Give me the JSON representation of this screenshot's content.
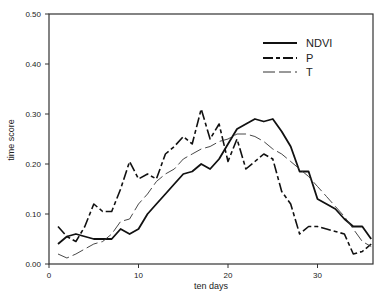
{
  "chart_data": {
    "type": "line",
    "title": "",
    "xlabel": "ten days",
    "ylabel": "time score",
    "xlim": [
      0,
      36.2
    ],
    "ylim": [
      0,
      0.5
    ],
    "xticks": [
      0,
      10,
      20,
      30
    ],
    "xtick_labels": [
      "0",
      "10",
      "20",
      "30"
    ],
    "yticks": [
      0,
      0.1,
      0.2,
      0.3,
      0.4,
      0.5
    ],
    "ytick_labels": [
      "0.00",
      "0.10",
      "0.20",
      "0.30",
      "0.40",
      "0.50"
    ],
    "grid": false,
    "legend_position": "upper right",
    "x": [
      1,
      2,
      3,
      4,
      5,
      6,
      7,
      8,
      9,
      10,
      11,
      12,
      13,
      14,
      15,
      16,
      17,
      18,
      19,
      20,
      21,
      22,
      23,
      24,
      25,
      26,
      27,
      28,
      29,
      30,
      31,
      32,
      33,
      34,
      35,
      36
    ],
    "series": [
      {
        "name": "NDVI",
        "style": "solid",
        "values": [
          0.04,
          0.055,
          0.06,
          0.055,
          0.05,
          0.05,
          0.05,
          0.07,
          0.06,
          0.07,
          0.1,
          0.12,
          0.14,
          0.16,
          0.18,
          0.185,
          0.2,
          0.19,
          0.21,
          0.24,
          0.27,
          0.28,
          0.29,
          0.285,
          0.29,
          0.265,
          0.235,
          0.185,
          0.185,
          0.13,
          0.12,
          0.11,
          0.09,
          0.075,
          0.075,
          0.05
        ]
      },
      {
        "name": "P",
        "style": "dash-dot",
        "values": [
          0.075,
          0.055,
          0.045,
          0.075,
          0.12,
          0.105,
          0.105,
          0.15,
          0.205,
          0.17,
          0.18,
          0.17,
          0.22,
          0.235,
          0.255,
          0.24,
          0.31,
          0.25,
          0.28,
          0.205,
          0.25,
          0.19,
          0.205,
          0.22,
          0.21,
          0.145,
          0.12,
          0.06,
          0.075,
          0.075,
          0.07,
          0.065,
          0.06,
          0.02,
          0.025,
          0.04
        ]
      },
      {
        "name": "T",
        "style": "long-dash",
        "values": [
          0.02,
          0.012,
          0.02,
          0.03,
          0.04,
          0.045,
          0.06,
          0.085,
          0.09,
          0.12,
          0.14,
          0.165,
          0.18,
          0.19,
          0.21,
          0.22,
          0.23,
          0.235,
          0.245,
          0.25,
          0.26,
          0.26,
          0.255,
          0.245,
          0.23,
          0.22,
          0.205,
          0.19,
          0.175,
          0.155,
          0.135,
          0.115,
          0.095,
          0.07,
          0.045,
          0.035
        ]
      }
    ]
  },
  "legend": {
    "items": [
      {
        "label": "NDVI"
      },
      {
        "label": "P"
      },
      {
        "label": "T"
      }
    ]
  }
}
